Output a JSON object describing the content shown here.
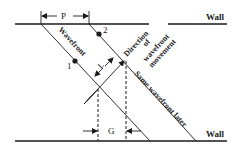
{
  "diagram": {
    "walls": {
      "top_label": "Wall",
      "bottom_label": "Wall"
    },
    "labels": {
      "period": "P",
      "wavefront": "Wavefront",
      "same_wavefront_later": "Same wavefront later",
      "direction_line1": "Direction",
      "direction_line2": "of",
      "direction_line3": "wavefront",
      "direction_line4": "movement",
      "distance": "L",
      "gap": "G",
      "point1": "1",
      "point2": "2"
    },
    "colors": {
      "ink": "#1a1a1a",
      "background": "#ffffff"
    }
  }
}
